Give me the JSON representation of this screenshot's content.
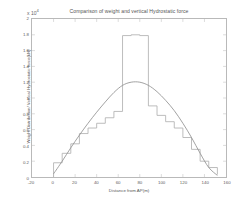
{
  "chart_data": {
    "type": "line",
    "title": "Comparison of weight and vertical Hydrostatic force",
    "xlabel": "Distance from AP(m)",
    "ylabel": "Weight Distribution/ Vertical Hydrostatic force(kN)",
    "y_exponent": "x 10",
    "y_exponent_power": "4",
    "xlim": [
      -20,
      160
    ],
    "ylim": [
      0,
      2
    ],
    "xticks": [
      -20,
      0,
      20,
      40,
      60,
      80,
      100,
      120,
      140,
      160
    ],
    "xtick_labels": [
      "-20",
      "0",
      "20",
      "40",
      "60",
      "80",
      "100",
      "120",
      "140",
      "160"
    ],
    "yticks": [
      0,
      0.2,
      0.4,
      0.6,
      0.8,
      1,
      1.2,
      1.4,
      1.6,
      1.8,
      2
    ],
    "ytick_labels": [
      "0",
      "0.2",
      "0.4",
      "0.6",
      "0.8",
      "1",
      "1.2",
      "1.4",
      "1.6",
      "1.8",
      "2"
    ],
    "grid": false,
    "legend": "none",
    "series": [
      {
        "name": "Weight Distribution",
        "style": "step",
        "color": "#b0b0b0",
        "x": [
          0,
          0,
          8,
          8,
          16,
          16,
          24,
          24,
          32,
          32,
          40,
          40,
          48,
          48,
          56,
          56,
          64,
          64,
          72,
          72,
          80,
          80,
          88,
          88,
          96,
          96,
          104,
          104,
          112,
          112,
          120,
          120,
          128,
          128,
          136,
          136,
          144,
          144,
          152,
          152
        ],
        "y": [
          0.0,
          0.18,
          0.18,
          0.3,
          0.3,
          0.42,
          0.42,
          0.55,
          0.55,
          0.62,
          0.62,
          0.68,
          0.68,
          0.75,
          0.75,
          0.83,
          0.83,
          1.79,
          1.79,
          1.8,
          1.8,
          1.79,
          1.79,
          0.9,
          0.9,
          0.78,
          0.78,
          0.7,
          0.7,
          0.62,
          0.62,
          0.5,
          0.5,
          0.35,
          0.35,
          0.2,
          0.2,
          0.12,
          0.12,
          0.03
        ]
      },
      {
        "name": "Vertical Hydrostatic force",
        "style": "smooth",
        "color": "#909090",
        "x": [
          0,
          8,
          16,
          24,
          32,
          40,
          48,
          56,
          64,
          72,
          80,
          88,
          96,
          104,
          112,
          120,
          128,
          136,
          144,
          152
        ],
        "y": [
          0.04,
          0.2,
          0.37,
          0.53,
          0.68,
          0.82,
          0.95,
          1.07,
          1.16,
          1.2,
          1.2,
          1.16,
          1.08,
          0.97,
          0.84,
          0.68,
          0.5,
          0.3,
          0.12,
          0.02
        ]
      }
    ]
  },
  "figure": {
    "background_color": "#ffffff",
    "axis_color": "#b9b9b9"
  }
}
